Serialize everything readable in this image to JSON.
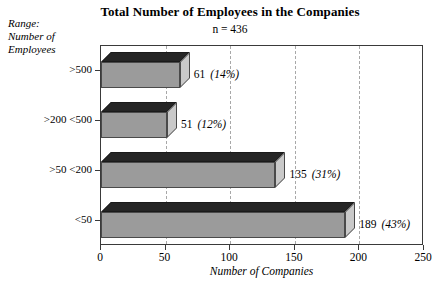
{
  "chart_data": {
    "type": "bar",
    "orientation": "horizontal",
    "title": "Total Number of Employees in the Companies",
    "subtitle": "n = 436",
    "ylabel_caption": [
      "Range:",
      "Number of",
      "Employees"
    ],
    "xlabel": "Number of  Companies",
    "ylabel": "",
    "xlim": [
      0,
      250
    ],
    "xticks": [
      "0",
      "50",
      "100",
      "150",
      "200",
      "250"
    ],
    "xtick_values": [
      0,
      50,
      100,
      150,
      200,
      250
    ],
    "grid": "vertical-dashed",
    "legend": "none",
    "categories": [
      ">500",
      ">200 <500",
      ">50 <200",
      "<50"
    ],
    "values": [
      61,
      51,
      135,
      189
    ],
    "percents": [
      "(14%)",
      "(12%)",
      "(31%)",
      "(43%)"
    ],
    "bars": [
      {
        "category": ">500",
        "value": 61,
        "value_label": "61",
        "percent_label": "(14%)"
      },
      {
        "category": ">200 <500",
        "value": 51,
        "value_label": "51",
        "percent_label": "(12%)"
      },
      {
        "category": ">50 <200",
        "value": 135,
        "value_label": "135",
        "percent_label": "(31%)"
      },
      {
        "category": "<50",
        "value": 189,
        "value_label": "189",
        "percent_label": "(43%)"
      }
    ],
    "colors": {
      "bar_front": "#9b9b9b",
      "bar_top": "#252525",
      "bar_side": "#c9c9c9",
      "frame": "#3a3a3a",
      "gridline": "#a8a8a8",
      "background": "#ffffff",
      "text": "#000000"
    }
  }
}
